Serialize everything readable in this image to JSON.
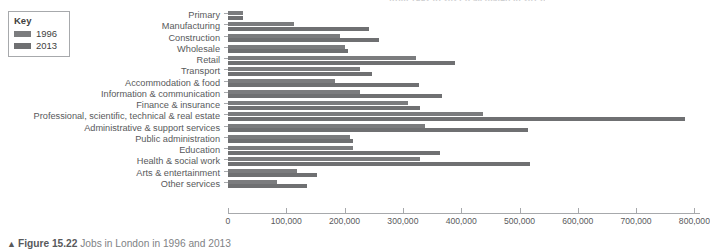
{
  "clipped_title": "from 1992 to 2021 (calculated in 2013)",
  "legend": {
    "title": "Key",
    "items": [
      {
        "label": "1996",
        "color": "#7b7c7e",
        "icon": "legend-swatch"
      },
      {
        "label": "2013",
        "color": "#6f7072",
        "icon": "legend-swatch"
      }
    ]
  },
  "caption": {
    "marker": "▲",
    "figure_number": "Figure 15.22",
    "text": "Jobs in London in 1996 and 2013"
  },
  "chart_data": {
    "type": "bar",
    "orientation": "horizontal",
    "title": "Jobs in London in 1996 and 2013",
    "xlabel": "",
    "ylabel": "",
    "xlim": [
      0,
      830000
    ],
    "grid": false,
    "legend_position": "top-left",
    "tick_labels": [
      "0",
      "100,000",
      "200,000",
      "300,000",
      "400,000",
      "500,000",
      "600,000",
      "700,000",
      "800,000"
    ],
    "tick_values": [
      0,
      100000,
      200000,
      300000,
      400000,
      500000,
      600000,
      700000,
      800000
    ],
    "categories": [
      "Primary",
      "Manufacturing",
      "Construction",
      "Wholesale",
      "Retail",
      "Transport",
      "Accommodation & food",
      "Information & communication",
      "Finance & insurance",
      "Professional, scientific, technical & real estate",
      "Administrative & support services",
      "Public administration",
      "Education",
      "Health & social work",
      "Arts & entertainment",
      "Other services"
    ],
    "series": [
      {
        "name": "1996",
        "color": "#7b7c7e",
        "values": [
          26000,
          113000,
          192000,
          200000,
          322000,
          226000,
          183000,
          226000,
          309000,
          437000,
          338000,
          209000,
          214000,
          330000,
          118000,
          84000
        ]
      },
      {
        "name": "2013",
        "color": "#6f7072",
        "values": [
          26000,
          242000,
          259000,
          206000,
          389000,
          247000,
          328000,
          367000,
          330000,
          784000,
          515000,
          214000,
          364000,
          518000,
          153000,
          136000
        ]
      }
    ]
  }
}
